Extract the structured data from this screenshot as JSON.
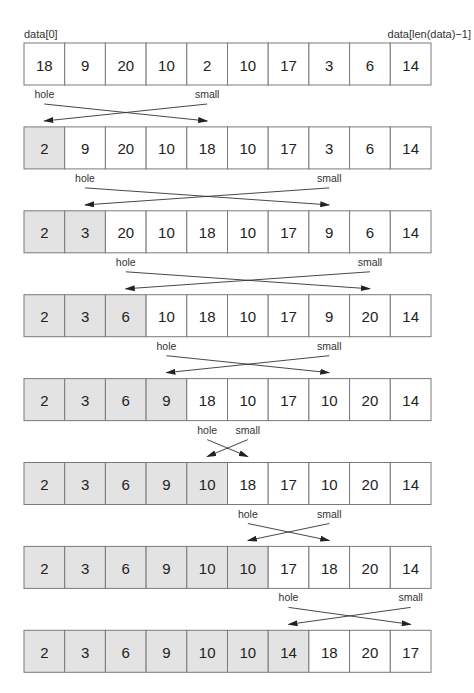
{
  "labels": {
    "first_index": "data[0]",
    "last_index": "data[len(data)−1]",
    "hole": "hole",
    "small": "small"
  },
  "colors": {
    "sorted_fill": "#e3e3e3",
    "unsorted_fill": "#ffffff",
    "border": "#7a7a7a"
  },
  "steps": [
    {
      "values": [
        18,
        9,
        20,
        10,
        2,
        10,
        17,
        3,
        6,
        14
      ],
      "sorted_count": 0,
      "hole": 0,
      "small": 4
    },
    {
      "values": [
        2,
        9,
        20,
        10,
        18,
        10,
        17,
        3,
        6,
        14
      ],
      "sorted_count": 1,
      "hole": 1,
      "small": 7
    },
    {
      "values": [
        2,
        3,
        20,
        10,
        18,
        10,
        17,
        9,
        6,
        14
      ],
      "sorted_count": 2,
      "hole": 2,
      "small": 8
    },
    {
      "values": [
        2,
        3,
        6,
        10,
        18,
        10,
        17,
        9,
        20,
        14
      ],
      "sorted_count": 3,
      "hole": 3,
      "small": 7
    },
    {
      "values": [
        2,
        3,
        6,
        9,
        18,
        10,
        17,
        10,
        20,
        14
      ],
      "sorted_count": 4,
      "hole": 4,
      "small": 5
    },
    {
      "values": [
        2,
        3,
        6,
        9,
        10,
        18,
        17,
        10,
        20,
        14
      ],
      "sorted_count": 5,
      "hole": 5,
      "small": 7
    },
    {
      "values": [
        2,
        3,
        6,
        9,
        10,
        10,
        17,
        18,
        20,
        14
      ],
      "sorted_count": 6,
      "hole": 6,
      "small": 9
    },
    {
      "values": [
        2,
        3,
        6,
        9,
        10,
        10,
        14,
        18,
        20,
        17
      ],
      "sorted_count": 7,
      "hole": null,
      "small": null
    }
  ]
}
